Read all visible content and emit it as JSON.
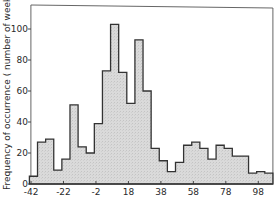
{
  "chart_data": {
    "type": "bar",
    "subtype": "histogram",
    "title": "",
    "xlabel": "",
    "ylabel": "Frequency of occurrence ( number of weeks )",
    "bin_width": 5,
    "bin_start": -43,
    "bin_end": 107,
    "bin_edges": [
      -43,
      -38,
      -33,
      -28,
      -23,
      -18,
      -13,
      -8,
      -3,
      2,
      7,
      12,
      17,
      22,
      27,
      32,
      37,
      42,
      47,
      52,
      57,
      62,
      67,
      72,
      77,
      82,
      87,
      92,
      97,
      102,
      107
    ],
    "values": [
      5,
      27,
      29,
      9,
      16,
      51,
      24,
      20,
      39,
      73,
      103,
      72,
      52,
      93,
      60,
      23,
      15,
      8,
      14,
      25,
      27,
      23,
      16,
      25,
      23,
      18,
      18,
      7,
      8,
      7
    ],
    "xticks": [
      -42,
      -22,
      -2,
      18,
      38,
      58,
      78,
      98
    ],
    "xtick_labels": [
      "-42",
      "-22",
      "-2",
      "18",
      "38",
      "58",
      "78",
      "98"
    ],
    "yticks": [
      0,
      20,
      40,
      60,
      80,
      100
    ],
    "ytick_labels": [
      "0",
      "20",
      "40",
      "60",
      "80",
      "100"
    ],
    "xlim": [
      -43,
      107
    ],
    "ylim": [
      0,
      115
    ],
    "grid": false,
    "legend": null,
    "fill_color": "#d9d9d9",
    "edge_color": "#333333"
  }
}
